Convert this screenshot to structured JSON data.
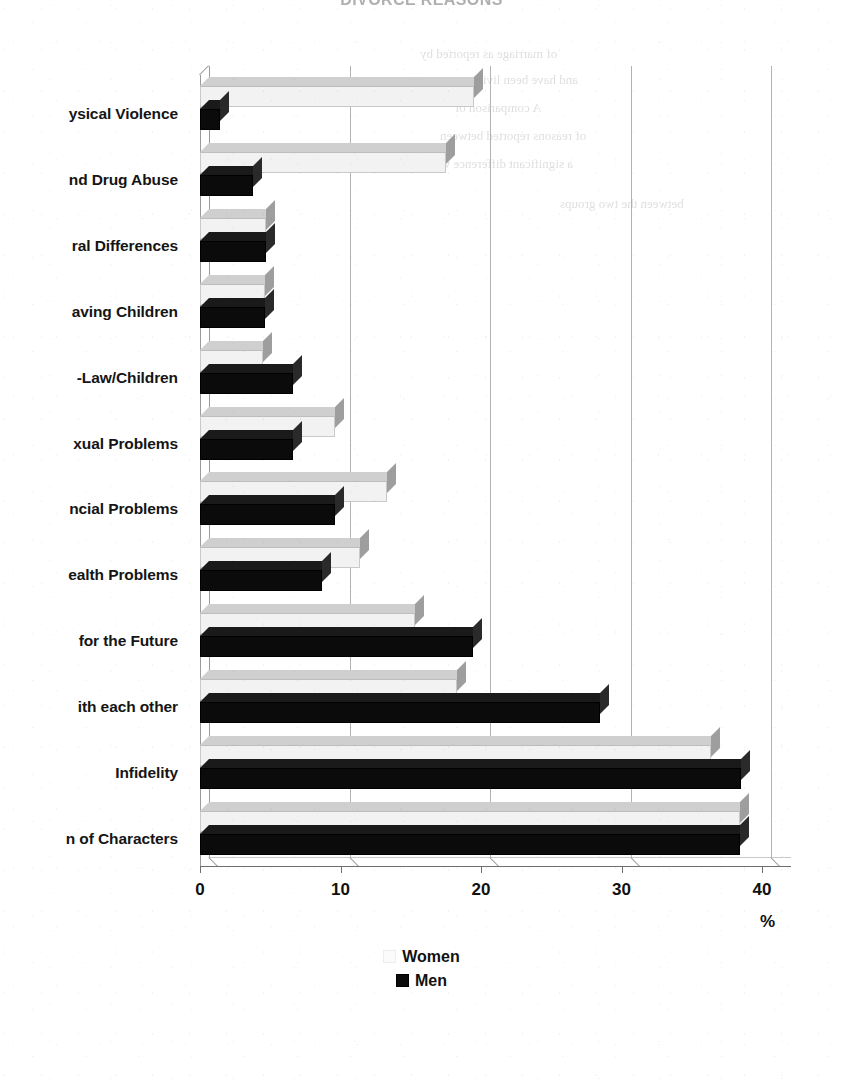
{
  "chart_title": "DIVORCE REASONS",
  "unit_label": "%",
  "ghost_texts": [
    "of marriage as reported by",
    "and have been living",
    "A comparison of",
    "of reasons reported between",
    "a significant difference was",
    "between the two groups"
  ],
  "legend": {
    "position": "bottom-center",
    "entries": [
      {
        "label": "Women",
        "swatch": "white-square-swatch"
      },
      {
        "label": "Men",
        "swatch": "black-square-swatch"
      }
    ]
  },
  "chart_data": {
    "type": "bar",
    "orientation": "horizontal",
    "title": "DIVORCE REASONS",
    "xlabel": "%",
    "ylabel": "",
    "xlim": [
      0,
      40
    ],
    "xticks": [
      0,
      10,
      20,
      30,
      40
    ],
    "xtick_labels": [
      "0",
      "10",
      "20",
      "30",
      "40"
    ],
    "grid": true,
    "legend_position": "bottom-center",
    "categories": [
      "Physical Violence",
      "Alcohol and Drug Abuse",
      "Cultural Differences",
      "Problems Having Children",
      "Problems with In-Law/Children",
      "Sexual Problems",
      "Financial Problems",
      "Health Problems",
      "Different Plans for the Future",
      "Not getting along with each other",
      "Infidelity",
      "Clash of Characters"
    ],
    "categories_displayed": [
      "ysical Violence",
      "nd Drug Abuse",
      "ral Differences",
      "aving Children",
      "-Law/Children",
      "xual Problems",
      "ncial Problems",
      "ealth Problems",
      "for the Future",
      "ith each other",
      "Infidelity",
      "n of Characters"
    ],
    "series": [
      {
        "name": "Women",
        "color": "#f2f2f2",
        "values": [
          19.5,
          17.5,
          4.7,
          4.6,
          4.5,
          9.6,
          13.3,
          11.4,
          15.3,
          18.3,
          36.4,
          38.4
        ]
      },
      {
        "name": "Men",
        "color": "#0b0b0b",
        "values": [
          1.4,
          3.8,
          4.7,
          4.6,
          6.6,
          6.6,
          9.6,
          8.7,
          19.4,
          28.5,
          38.5,
          38.4
        ]
      }
    ]
  }
}
